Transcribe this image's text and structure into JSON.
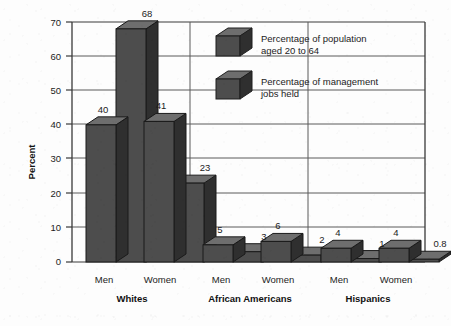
{
  "chart_data": {
    "type": "bar",
    "title": "",
    "xlabel": "",
    "ylabel": "Percent",
    "ylim": [
      0,
      70
    ],
    "ytick_step": 10,
    "yticks": [
      "0",
      "10",
      "20",
      "30",
      "40",
      "50",
      "60",
      "70"
    ],
    "grid": true,
    "legend_position": "top-right-inside",
    "style": "3d-bars-grayscale",
    "groups": [
      {
        "name": "Whites",
        "subgroups": [
          "Men",
          "Women"
        ]
      },
      {
        "name": "African Americans",
        "subgroups": [
          "Men",
          "Women"
        ]
      },
      {
        "name": "Hispanics",
        "subgroups": [
          "Men",
          "Women"
        ]
      }
    ],
    "categories": [
      "Whites - Men",
      "Whites - Women",
      "African Americans - Men",
      "African Americans - Women",
      "Hispanics - Men",
      "Hispanics - Women"
    ],
    "series": [
      {
        "name": "Percentage of population aged 20 to 64",
        "values": [
          40,
          41,
          5,
          6,
          4,
          4
        ],
        "labels": [
          "40",
          "41",
          "5",
          "6",
          "4",
          "4"
        ],
        "color": "#4a4a4a"
      },
      {
        "name": "Percentage of management jobs held",
        "values": [
          68,
          23,
          3,
          2,
          1,
          0.8
        ],
        "labels": [
          "68",
          "23",
          "3",
          "2",
          "1",
          "0.8"
        ],
        "color": "#4a4a4a"
      }
    ]
  },
  "legend": {
    "items": [
      {
        "label_line1": "Percentage of population",
        "label_line2": "aged 20 to 64"
      },
      {
        "label_line1": "Percentage of management",
        "label_line2": "jobs held"
      }
    ]
  },
  "axis": {
    "y_title": "Percent"
  },
  "colors": {
    "bar_front": "#4d4d4d",
    "bar_top": "#6e6e6e",
    "bar_side": "#2f2f2f",
    "frame": "#3a3a3a",
    "grid": "#5a5a5a",
    "text": "#1c1c1c",
    "background": "#fdfdfd"
  }
}
